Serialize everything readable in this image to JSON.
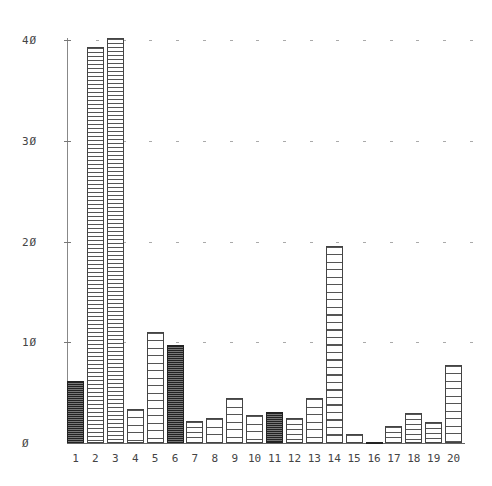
{
  "chart_data": {
    "type": "bar",
    "title": "",
    "xlabel": "",
    "ylabel": "",
    "ylim": [
      0,
      40
    ],
    "yticks": [
      0,
      10,
      20,
      30,
      40
    ],
    "ytick_labels": [
      "Ø",
      "1Ø",
      "2Ø",
      "3Ø",
      "4Ø"
    ],
    "grid": "dashed horizontal at each y tick",
    "legend": null,
    "categories": [
      "1",
      "2",
      "3",
      "4",
      "5",
      "6",
      "7",
      "8",
      "9",
      "10",
      "11",
      "12",
      "13",
      "14",
      "15",
      "16",
      "17",
      "18",
      "19",
      "20"
    ],
    "values": [
      6.2,
      39.3,
      40.2,
      3.4,
      11.0,
      9.7,
      2.2,
      2.5,
      4.5,
      2.8,
      3.1,
      2.5,
      4.5,
      19.6,
      0.9,
      0.1,
      1.7,
      3.0,
      2.1,
      7.7
    ],
    "bar_styles": [
      "dark",
      "dense",
      "dense",
      "sparse",
      "sparse",
      "dark",
      "medium",
      "sparse",
      "sparse",
      "sparse",
      "dark",
      "medium",
      "sparse",
      "sparse",
      "sparse",
      "dark",
      "medium",
      "medium",
      "medium",
      "sparse"
    ]
  }
}
